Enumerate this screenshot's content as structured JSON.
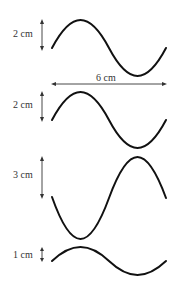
{
  "diagram": {
    "wavelength_label": "6 cm",
    "waves": [
      {
        "id": "wave-1",
        "amplitude_label": "2 cm",
        "phase": "starts upward",
        "midline_y": 48,
        "amp_px": 28
      },
      {
        "id": "wave-2",
        "amplitude_label": "2 cm",
        "phase": "starts upward",
        "midline_y": 120,
        "amp_px": 28
      },
      {
        "id": "wave-3",
        "amplitude_label": "3 cm",
        "phase": "starts downward",
        "midline_y": 198,
        "amp_px": 41
      },
      {
        "id": "wave-4",
        "amplitude_label": "1 cm",
        "phase": "starts upward",
        "midline_y": 261,
        "amp_px": 14
      }
    ],
    "colors": {
      "wave": "#111111",
      "text": "#333333",
      "background": "#ffffff"
    }
  }
}
